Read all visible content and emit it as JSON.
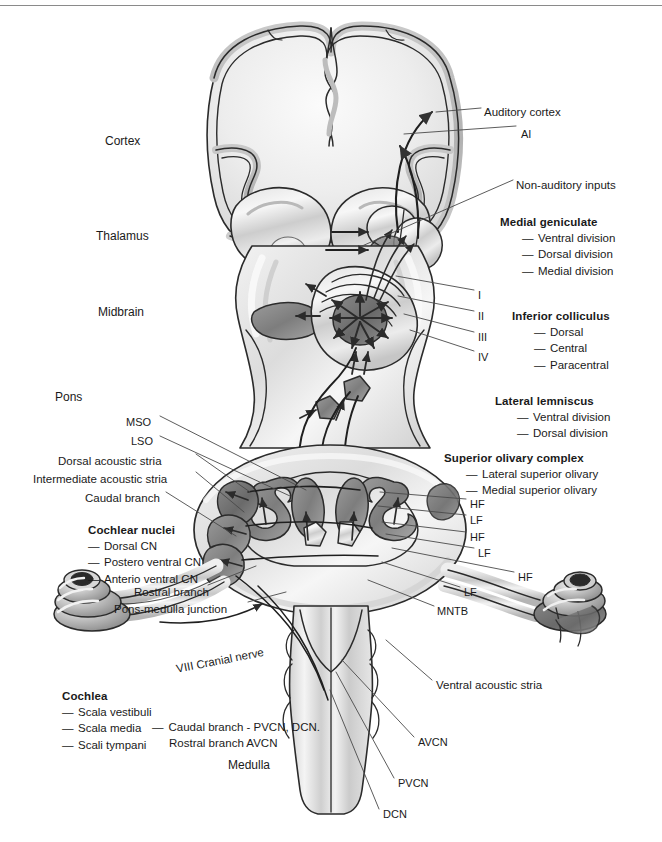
{
  "figure": {
    "colors": {
      "ink": "#1a1a1a",
      "rule": "#8a8a8a",
      "tissue_light": "#e6e6e6",
      "tissue_mid": "#c2c2c2",
      "tissue_dark": "#9a9a9a",
      "nucleus_dark": "#7b7b7b",
      "nucleus_darker": "#5f5f5f",
      "outline": "#2b2b2b",
      "leader": "#4a4a4a"
    }
  },
  "level_labels": [
    {
      "text": "Cortex",
      "x": 105,
      "y": 134
    },
    {
      "text": "Thalamus",
      "x": 96,
      "y": 229
    },
    {
      "text": "Midbrain",
      "x": 98,
      "y": 305
    },
    {
      "text": "Pons",
      "x": 55,
      "y": 390
    },
    {
      "text": "Medulla",
      "x": 228,
      "y": 758
    }
  ],
  "leader_labels": [
    {
      "name": "auditory-cortex",
      "text": "Auditory cortex",
      "x": 484,
      "y": 105
    },
    {
      "name": "ai",
      "text": "AI",
      "x": 521,
      "y": 127
    },
    {
      "name": "non-auditory-inputs",
      "text": "Non-auditory inputs",
      "x": 516,
      "y": 178
    },
    {
      "name": "ic-layer-1",
      "text": "I",
      "x": 478,
      "y": 288
    },
    {
      "name": "ic-layer-2",
      "text": "II",
      "x": 478,
      "y": 309
    },
    {
      "name": "ic-layer-3",
      "text": "III",
      "x": 478,
      "y": 330
    },
    {
      "name": "ic-layer-4",
      "text": "IV",
      "x": 478,
      "y": 350
    },
    {
      "name": "mso",
      "text": "MSO",
      "x": 126,
      "y": 415
    },
    {
      "name": "lso",
      "text": "LSO",
      "x": 131,
      "y": 434
    },
    {
      "name": "dorsal-acoustic-stria",
      "text": "Dorsal acoustic stria",
      "x": 58,
      "y": 454
    },
    {
      "name": "intermediate-acoustic-stria",
      "text": "Intermediate acoustic stria",
      "x": 33,
      "y": 472
    },
    {
      "name": "caudal-branch",
      "text": "Caudal branch",
      "x": 85,
      "y": 491
    },
    {
      "name": "rostral-branch",
      "text": "Rostral branch",
      "x": 134,
      "y": 585
    },
    {
      "name": "pons-medulla-junction",
      "text": "Pons-medulla junction",
      "x": 114,
      "y": 602
    },
    {
      "name": "hf-1",
      "text": "HF",
      "x": 470,
      "y": 497
    },
    {
      "name": "lf-1",
      "text": "LF",
      "x": 470,
      "y": 513
    },
    {
      "name": "hf-2",
      "text": "HF",
      "x": 470,
      "y": 530
    },
    {
      "name": "lf-2",
      "text": "LF",
      "x": 478,
      "y": 546
    },
    {
      "name": "hf-3",
      "text": "HF",
      "x": 518,
      "y": 570
    },
    {
      "name": "lf-3",
      "text": "LF",
      "x": 464,
      "y": 585
    },
    {
      "name": "mntb",
      "text": "MNTB",
      "x": 437,
      "y": 604
    },
    {
      "name": "viii-cranial-nerve",
      "text": "VIII Cranial nerve",
      "x": 175,
      "y": 662,
      "rotate": -11
    },
    {
      "name": "ventral-acoustic-stria",
      "text": "Ventral acoustic stria",
      "x": 436,
      "y": 678
    },
    {
      "name": "avcn",
      "text": "AVCN",
      "x": 418,
      "y": 735
    },
    {
      "name": "pvcn",
      "text": "PVCN",
      "x": 398,
      "y": 776
    },
    {
      "name": "dcn",
      "text": "DCN",
      "x": 383,
      "y": 807
    }
  ],
  "blocks": [
    {
      "name": "medial-geniculate",
      "heading": "Medial geniculate",
      "items": [
        "Ventral division",
        "Dorsal  division",
        "Medial division"
      ],
      "x": 500,
      "y": 216,
      "indent": true
    },
    {
      "name": "inferior-colliculus",
      "heading": "Inferior colliculus",
      "items": [
        "Dorsal",
        "Central",
        "Paracentral"
      ],
      "x": 512,
      "y": 310,
      "indent": true
    },
    {
      "name": "lateral-lemniscus",
      "heading": "Lateral lemniscus",
      "items": [
        "Ventral division",
        "Dorsal  division"
      ],
      "x": 495,
      "y": 395,
      "indent": true
    },
    {
      "name": "superior-olivary-complex",
      "heading": "Superior olivary complex",
      "items": [
        "Lateral superior olivary",
        "Medial superior olivary"
      ],
      "x": 444,
      "y": 452,
      "indent": true
    },
    {
      "name": "cochlear-nuclei",
      "heading": "Cochlear nuclei",
      "items": [
        "Dorsal CN",
        "Postero ventral CN",
        "Anterio ventral CN"
      ],
      "x": 88,
      "y": 524,
      "indent": false
    },
    {
      "name": "cochlea",
      "heading": "Cochlea",
      "items": [
        "Scala vestibuli",
        "Scala media",
        "Scali tympani"
      ],
      "x": 62,
      "y": 690,
      "indent": false
    }
  ],
  "note_block": {
    "name": "branch-note",
    "dash": "—",
    "line1": "Caudal branch - PVCN, DCN.",
    "line2": "Rostral branch AVCN",
    "x": 152,
    "y": 719
  },
  "dash_glyph": "—"
}
